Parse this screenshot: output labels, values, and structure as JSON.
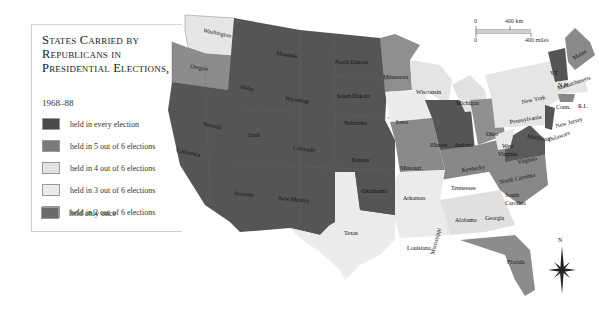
{
  "legend": {
    "title_lines": [
      "States Carried by",
      "Republicans in",
      "Presidential Elections,"
    ],
    "years": "1968–88",
    "items": [
      {
        "label": "held in every election",
        "color": "#4a4a4a"
      },
      {
        "label": "held in 5 out of 6 elections",
        "color": "#7a7a7a"
      },
      {
        "label": "held in 4 out of 6 elections",
        "color": "#e3e3e3"
      },
      {
        "label": "held in 3 out of 6 elections",
        "color": "#ebebeb"
      },
      {
        "label": "held in 2 out of 6 elections",
        "color": "#d0d0d0"
      },
      {
        "label": "held only once",
        "color": "#6b6b6b"
      }
    ]
  },
  "scale_bar": {
    "km_start": "0",
    "km_end": "400 km",
    "mi_start": "0",
    "mi_end": "400 miles"
  },
  "compass": {
    "north_label": "N"
  },
  "states": {
    "washington": "Washington",
    "oregon": "Oregon",
    "california": "California",
    "nevada": "Nevada",
    "idaho": "Idaho",
    "montana": "Montana",
    "wyoming": "Wyoming",
    "utah": "Utah",
    "arizona": "Arizona",
    "colorado": "Colorado",
    "new_mexico": "New Mexico",
    "north_dakota": "North Dakota",
    "south_dakota": "South Dakota",
    "nebraska": "Nebraska",
    "kansas": "Kansas",
    "oklahoma": "Oklahoma",
    "texas": "Texas",
    "minnesota": "Minnesota",
    "iowa": "Iowa",
    "missouri": "Missouri",
    "arkansas": "Arkansas",
    "louisiana": "Louisiana",
    "wisconsin": "Wisconsin",
    "illinois": "Illinois",
    "michigan": "Michigan",
    "indiana": "Indiana",
    "ohio": "Ohio",
    "kentucky": "Kentucky",
    "tennessee": "Tennessee",
    "mississippi": "Mississippi",
    "alabama": "Alabama",
    "georgia": "Georgia",
    "florida": "Florida",
    "south_carolina_1": "South",
    "south_carolina_2": "Carolina",
    "north_carolina": "North Carolina",
    "virginia": "Virginia",
    "west_virginia_1": "West",
    "west_virginia_2": "Virginia",
    "pennsylvania": "Pennsylvania",
    "new_york": "New York",
    "maryland": "Maryland",
    "delaware": "Delaware",
    "new_jersey": "New Jersey",
    "connecticut": "Conn.",
    "rhode_island": "R.I.",
    "massachusetts": "Massachusetts",
    "vermont": "VT",
    "new_hampshire": "N.H.",
    "maine": "Maine"
  }
}
